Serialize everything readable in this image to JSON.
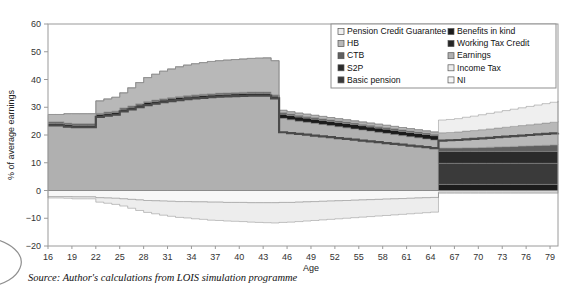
{
  "figure": {
    "source_note": "Source: Author's calculations from LOIS simulation programme"
  },
  "chart_data": {
    "type": "area",
    "title": "",
    "subtitle": "",
    "xlabel": "Age",
    "ylabel": "% of average earnings",
    "xlim": [
      16,
      80
    ],
    "ylim": [
      -20,
      60
    ],
    "grid": false,
    "legend_position": "top-right",
    "stacked": true,
    "baseline": 0,
    "xticks": [
      16,
      19,
      22,
      25,
      28,
      31,
      34,
      37,
      40,
      43,
      46,
      49,
      52,
      55,
      58,
      61,
      64,
      67,
      70,
      73,
      76,
      79
    ],
    "yticks": [
      -20,
      -10,
      0,
      10,
      20,
      30,
      40,
      50,
      60
    ],
    "colors": {
      "pension_credit_guarantee": "#efefef",
      "hb": "#b8b8b8",
      "ctb": "#5f5f5f",
      "s2p": "#2b2b2b",
      "basic_pension": "#3a3a3a",
      "benefits_in_kind": "#1c1c1c",
      "working_tax_credit": "#262626",
      "earnings": "#b0b0b0",
      "income_tax": "#ededed",
      "ni": "#f7f7f7",
      "frame": "#9a9a9a",
      "legend_border": "#8f8f8f",
      "axis_text": "#333333"
    },
    "legend": [
      {
        "label": "Pension Credit Guarantee",
        "swatch": "#efefef",
        "column": 1
      },
      {
        "label": "HB",
        "swatch": "#b8b8b8",
        "column": 1
      },
      {
        "label": "CTB",
        "swatch": "#5f5f5f",
        "column": 1
      },
      {
        "label": "S2P",
        "swatch": "#2b2b2b",
        "column": 1
      },
      {
        "label": "Basic pension",
        "swatch": "#3a3a3a",
        "column": 1
      },
      {
        "label": "Benefits in kind",
        "swatch": "#1c1c1c",
        "column": 2
      },
      {
        "label": "Working Tax Credit",
        "swatch": "#262626",
        "column": 2
      },
      {
        "label": "Earnings",
        "swatch": "#b0b0b0",
        "column": 2
      },
      {
        "label": "Income Tax",
        "swatch": "#ededed",
        "column": 2
      },
      {
        "label": "NI",
        "swatch": "#f7f7f7",
        "column": 2
      }
    ],
    "x": [
      16,
      17,
      18,
      19,
      20,
      21,
      22,
      23,
      24,
      25,
      26,
      27,
      28,
      29,
      30,
      31,
      32,
      33,
      34,
      35,
      36,
      37,
      38,
      39,
      40,
      41,
      42,
      43,
      44,
      45,
      46,
      47,
      48,
      49,
      50,
      51,
      52,
      53,
      54,
      55,
      56,
      57,
      58,
      59,
      60,
      61,
      62,
      63,
      64,
      65,
      66,
      67,
      68,
      69,
      70,
      71,
      72,
      73,
      74,
      75,
      76,
      77,
      78,
      79,
      80
    ],
    "series": [
      {
        "name": "Earnings",
        "swatch": "#b0b0b0",
        "values": [
          23.5,
          23.5,
          23.0,
          22.8,
          22.8,
          22.8,
          26.5,
          27.0,
          27.3,
          28.5,
          29.2,
          30.0,
          30.8,
          31.3,
          31.8,
          32.2,
          32.6,
          32.9,
          33.2,
          33.4,
          33.6,
          33.8,
          33.9,
          34.0,
          34.1,
          34.2,
          34.2,
          34.2,
          33.2,
          26.0,
          25.5,
          25.0,
          24.6,
          24.2,
          23.8,
          23.4,
          23.0,
          22.6,
          22.2,
          21.8,
          21.4,
          21.0,
          20.6,
          20.2,
          19.8,
          19.4,
          19.0,
          18.6,
          18.2,
          0,
          0,
          0,
          0,
          0,
          0,
          0,
          0,
          0,
          0,
          0,
          0,
          0,
          0,
          0,
          0
        ]
      },
      {
        "name": "Benefits in kind",
        "swatch": "#1c1c1c",
        "values": [
          0.8,
          0.8,
          0.8,
          0.8,
          0.8,
          0.8,
          0.9,
          0.9,
          0.9,
          0.9,
          0.9,
          0.9,
          0.9,
          0.9,
          0.9,
          0.9,
          0.9,
          0.9,
          0.9,
          0.9,
          0.9,
          0.9,
          0.9,
          0.9,
          0.9,
          0.9,
          0.9,
          0.9,
          0.9,
          1.6,
          1.6,
          1.6,
          1.6,
          1.6,
          1.6,
          1.6,
          1.6,
          1.6,
          1.6,
          1.6,
          1.6,
          1.6,
          1.6,
          1.6,
          1.6,
          1.6,
          1.6,
          1.6,
          1.6,
          2.2,
          2.2,
          2.2,
          2.2,
          2.2,
          2.2,
          2.2,
          2.2,
          2.2,
          2.2,
          2.2,
          2.2,
          2.2,
          2.2,
          2.2,
          2.2
        ]
      },
      {
        "name": "Working Tax Credit",
        "swatch": "#262626",
        "values": [
          0,
          0,
          0,
          0,
          0,
          0,
          0,
          0,
          0,
          0,
          0,
          0,
          0,
          0,
          0,
          0,
          0,
          0,
          0,
          0,
          0,
          0,
          0,
          0,
          0,
          0,
          0,
          0,
          0,
          0,
          0,
          0,
          0,
          0,
          0,
          0,
          0,
          0,
          0,
          0,
          0,
          0,
          0,
          0,
          0,
          0,
          0,
          0,
          0,
          0,
          0,
          0,
          0,
          0,
          0,
          0,
          0,
          0,
          0,
          0,
          0,
          0,
          0,
          0,
          0
        ]
      },
      {
        "name": "Basic pension",
        "swatch": "#3a3a3a",
        "values": [
          0,
          0,
          0,
          0,
          0,
          0,
          0,
          0,
          0,
          0,
          0,
          0,
          0,
          0,
          0,
          0,
          0,
          0,
          0,
          0,
          0,
          0,
          0,
          0,
          0,
          0,
          0,
          0,
          0,
          0,
          0,
          0,
          0,
          0,
          0,
          0,
          0,
          0,
          0,
          0,
          0,
          0,
          0,
          0,
          0,
          0,
          0,
          0,
          0,
          7.6,
          7.6,
          7.6,
          7.6,
          7.6,
          7.6,
          7.6,
          7.6,
          7.6,
          7.6,
          7.6,
          7.6,
          7.6,
          7.6,
          7.6,
          7.6
        ]
      },
      {
        "name": "S2P",
        "swatch": "#2b2b2b",
        "values": [
          0,
          0,
          0,
          0,
          0,
          0,
          0,
          0,
          0,
          0,
          0,
          0,
          0,
          0,
          0,
          0,
          0,
          0,
          0,
          0,
          0,
          0,
          0,
          0,
          0,
          0,
          0,
          0,
          0,
          0,
          0,
          0,
          0,
          0,
          0,
          0,
          0,
          0,
          0,
          0,
          0,
          0,
          0,
          0,
          0,
          0,
          0,
          0,
          0,
          4.3,
          4.3,
          4.3,
          4.3,
          4.3,
          4.3,
          4.3,
          4.3,
          4.3,
          4.3,
          4.3,
          4.3,
          4.3,
          4.3,
          4.3,
          4.3
        ]
      },
      {
        "name": "CTB",
        "swatch": "#5f5f5f",
        "values": [
          0.5,
          0.5,
          0.5,
          0.5,
          0.5,
          0.5,
          0.4,
          0.4,
          0.4,
          0.4,
          0.4,
          0.4,
          0.4,
          0.4,
          0.4,
          0.4,
          0.4,
          0.4,
          0.4,
          0.4,
          0.4,
          0.4,
          0.4,
          0.4,
          0.4,
          0.4,
          0.4,
          0.4,
          0.4,
          0.5,
          0.5,
          0.5,
          0.5,
          0.5,
          0.5,
          0.5,
          0.5,
          0.5,
          0.5,
          0.5,
          0.5,
          0.5,
          0.5,
          0.5,
          0.5,
          0.5,
          0.5,
          0.5,
          0.5,
          1.2,
          1.2,
          1.2,
          1.3,
          1.3,
          1.4,
          1.5,
          1.6,
          1.7,
          1.8,
          1.9,
          2.0,
          2.1,
          2.2,
          2.3,
          2.4
        ]
      },
      {
        "name": "HB",
        "swatch": "#b8b8b8",
        "values": [
          2.6,
          2.6,
          3.4,
          3.6,
          3.6,
          3.6,
          4.5,
          4.7,
          5.0,
          5.4,
          6.5,
          7.6,
          8.6,
          9.3,
          9.9,
          10.3,
          10.7,
          11.0,
          11.2,
          11.4,
          11.6,
          11.7,
          11.8,
          11.9,
          12.0,
          12.1,
          12.2,
          12.3,
          12.3,
          0.8,
          0.8,
          0.8,
          0.8,
          0.8,
          0.8,
          0.8,
          0.8,
          0.8,
          0.8,
          0.8,
          0.8,
          0.8,
          0.8,
          0.8,
          0.8,
          0.8,
          0.8,
          0.8,
          0.8,
          5.5,
          5.6,
          5.8,
          6.0,
          6.2,
          6.4,
          6.6,
          6.8,
          7.0,
          7.2,
          7.4,
          7.6,
          7.8,
          8.0,
          8.2,
          8.4
        ]
      },
      {
        "name": "Pension Credit Guarantee",
        "swatch": "#efefef",
        "values": [
          0,
          0,
          0,
          0,
          0,
          0,
          0,
          0,
          0,
          0,
          0,
          0,
          0,
          0,
          0,
          0,
          0,
          0,
          0,
          0,
          0,
          0,
          0,
          0,
          0,
          0,
          0,
          0,
          0,
          0,
          0,
          0,
          0,
          0,
          0,
          0,
          0,
          0,
          0,
          0,
          0,
          0,
          0,
          0,
          0,
          0,
          0,
          0,
          0,
          4.6,
          4.7,
          4.8,
          5.0,
          5.2,
          5.4,
          5.6,
          5.8,
          6.0,
          6.2,
          6.4,
          6.6,
          6.8,
          7.0,
          7.2,
          7.4
        ]
      }
    ],
    "negative_series": [
      {
        "name": "NI",
        "swatch": "#f7f7f7",
        "values": [
          -2.2,
          -2.2,
          -2.2,
          -2.3,
          -2.3,
          -2.3,
          -2.6,
          -2.7,
          -2.8,
          -3.0,
          -3.2,
          -3.4,
          -3.6,
          -3.7,
          -3.8,
          -3.9,
          -4.0,
          -4.0,
          -4.1,
          -4.1,
          -4.2,
          -4.2,
          -4.3,
          -4.3,
          -4.3,
          -4.4,
          -4.4,
          -4.4,
          -4.4,
          -4.3,
          -4.3,
          -4.2,
          -4.1,
          -4.0,
          -3.9,
          -3.8,
          -3.7,
          -3.6,
          -3.5,
          -3.4,
          -3.3,
          -3.2,
          -3.1,
          -3.0,
          -2.9,
          -2.8,
          -2.7,
          -2.6,
          -2.5,
          -0.6,
          -0.6,
          -0.6,
          -0.6,
          -0.6,
          -0.6,
          -0.6,
          -0.6,
          -0.6,
          -0.6,
          -0.6,
          -0.6,
          -0.6,
          -0.6,
          -0.6,
          -0.6
        ]
      },
      {
        "name": "Income Tax",
        "swatch": "#ededed",
        "values": [
          -0.5,
          -0.5,
          -0.6,
          -0.7,
          -0.7,
          -0.7,
          -1.6,
          -1.9,
          -2.2,
          -2.6,
          -3.2,
          -3.8,
          -4.3,
          -4.7,
          -5.1,
          -5.4,
          -5.7,
          -5.9,
          -6.1,
          -6.3,
          -6.5,
          -6.6,
          -6.7,
          -6.8,
          -6.9,
          -7.0,
          -7.1,
          -7.2,
          -7.3,
          -7.2,
          -7.1,
          -7.0,
          -6.9,
          -6.8,
          -6.7,
          -6.6,
          -6.5,
          -6.4,
          -6.3,
          -6.2,
          -6.1,
          -6.0,
          -5.9,
          -5.8,
          -5.7,
          -5.6,
          -5.5,
          -5.4,
          -5.3,
          -0.4,
          -0.4,
          -0.4,
          -0.4,
          -0.4,
          -0.4,
          -0.4,
          -0.4,
          -0.4,
          -0.4,
          -0.4,
          -0.4,
          -0.4,
          -0.4,
          -0.4,
          -0.4
        ]
      }
    ],
    "overlay_line": {
      "name": "net-income-line",
      "color": "#4a4a4a",
      "values": [
        23.5,
        23.5,
        23.0,
        22.8,
        22.8,
        22.8,
        26.5,
        27.0,
        27.3,
        28.5,
        29.2,
        30.0,
        30.8,
        31.3,
        31.8,
        32.2,
        32.6,
        32.9,
        33.2,
        33.4,
        33.6,
        33.8,
        33.9,
        34.0,
        34.1,
        34.2,
        34.2,
        34.2,
        33.2,
        21.0,
        20.7,
        20.4,
        20.1,
        19.8,
        19.5,
        19.2,
        18.9,
        18.6,
        18.3,
        18.0,
        17.7,
        17.4,
        17.1,
        16.8,
        16.5,
        16.2,
        15.9,
        15.6,
        15.3,
        18.0,
        18.1,
        18.2,
        18.4,
        18.6,
        18.8,
        19.0,
        19.2,
        19.4,
        19.6,
        19.8,
        20.0,
        20.2,
        20.4,
        20.6,
        20.8
      ]
    }
  }
}
